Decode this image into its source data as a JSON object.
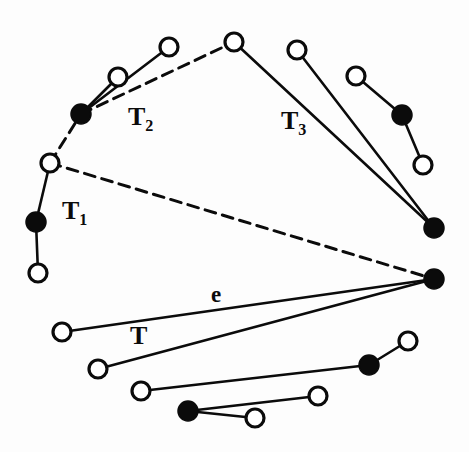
{
  "figure": {
    "background_color": "#fdfdfd",
    "stroke_color": "#0b0b0b",
    "node_fill_open": "#ffffff",
    "node_fill_closed": "#0b0b0b",
    "node_radius": 9,
    "node_stroke_width": 3.2,
    "edge_width_solid": 2.6,
    "edge_width_dashed": 3.0,
    "dash_pattern": "11 7"
  },
  "labels": [
    {
      "id": "label-t1",
      "text": "T",
      "sub": "1",
      "x": 62,
      "y": 198,
      "size": 26
    },
    {
      "id": "label-t2",
      "text": "T",
      "sub": "2",
      "x": 128,
      "y": 104,
      "size": 26
    },
    {
      "id": "label-t3",
      "text": "T",
      "sub": "3",
      "x": 281,
      "y": 108,
      "size": 26
    },
    {
      "id": "label-e",
      "text": "e",
      "sub": "",
      "x": 211,
      "y": 283,
      "size": 23
    },
    {
      "id": "label-t",
      "text": "T",
      "sub": "",
      "x": 130,
      "y": 323,
      "size": 26
    }
  ],
  "nodes": [
    {
      "id": "n-t2-hub",
      "x": 81,
      "y": 114,
      "type": "closed"
    },
    {
      "id": "n-t2-mid",
      "x": 118,
      "y": 77,
      "type": "open"
    },
    {
      "id": "n-t2-far",
      "x": 169,
      "y": 47,
      "type": "open"
    },
    {
      "id": "n-apex",
      "x": 234,
      "y": 42,
      "type": "open"
    },
    {
      "id": "n-top-right",
      "x": 297,
      "y": 50,
      "type": "open"
    },
    {
      "id": "n-right-upper",
      "x": 356,
      "y": 76,
      "type": "open"
    },
    {
      "id": "n-right-mid",
      "x": 402,
      "y": 115,
      "type": "closed"
    },
    {
      "id": "n-right-low",
      "x": 423,
      "y": 165,
      "type": "open"
    },
    {
      "id": "n-right-sink",
      "x": 434,
      "y": 228,
      "type": "closed"
    },
    {
      "id": "n-hub",
      "x": 434,
      "y": 279,
      "type": "closed"
    },
    {
      "id": "n-t1-top",
      "x": 50,
      "y": 163,
      "type": "open"
    },
    {
      "id": "n-t1-mid",
      "x": 36,
      "y": 222,
      "type": "closed"
    },
    {
      "id": "n-t1-bot",
      "x": 38,
      "y": 273,
      "type": "open"
    },
    {
      "id": "n-low-1",
      "x": 62,
      "y": 332,
      "type": "open"
    },
    {
      "id": "n-low-2",
      "x": 98,
      "y": 369,
      "type": "open"
    },
    {
      "id": "n-low-3",
      "x": 141,
      "y": 391,
      "type": "open"
    },
    {
      "id": "n-low-4",
      "x": 188,
      "y": 411,
      "type": "closed"
    },
    {
      "id": "n-low-5",
      "x": 255,
      "y": 418,
      "type": "open"
    },
    {
      "id": "n-low-6",
      "x": 318,
      "y": 396,
      "type": "open"
    },
    {
      "id": "n-low-7",
      "x": 369,
      "y": 365,
      "type": "closed"
    },
    {
      "id": "n-low-8",
      "x": 408,
      "y": 341,
      "type": "open"
    }
  ],
  "edges_solid": [
    {
      "id": "e-t2-hub-mid",
      "from": "n-t2-hub",
      "to": "n-t2-mid"
    },
    {
      "id": "e-t2-hub-far",
      "from": "n-t2-hub",
      "to": "n-t2-far"
    },
    {
      "id": "e-apex-sink",
      "from": "n-apex",
      "to": "n-right-sink"
    },
    {
      "id": "e-topright-sink",
      "from": "n-top-right",
      "to": "n-right-sink"
    },
    {
      "id": "e-rupper-rmid",
      "from": "n-right-upper",
      "to": "n-right-mid"
    },
    {
      "id": "e-rmid-rlow",
      "from": "n-right-mid",
      "to": "n-right-low"
    },
    {
      "id": "e-t1-top-mid",
      "from": "n-t1-top",
      "to": "n-t1-mid"
    },
    {
      "id": "e-t1-mid-bot",
      "from": "n-t1-mid",
      "to": "n-t1-bot"
    },
    {
      "id": "e-low1-hub",
      "from": "n-low-1",
      "to": "n-hub"
    },
    {
      "id": "e-low2-hub",
      "from": "n-low-2",
      "to": "n-hub"
    },
    {
      "id": "e-low3-low7",
      "from": "n-low-3",
      "to": "n-low-7"
    },
    {
      "id": "e-low7-low8",
      "from": "n-low-7",
      "to": "n-low-8"
    },
    {
      "id": "e-low4-low5",
      "from": "n-low-4",
      "to": "n-low-5"
    },
    {
      "id": "e-low4-low6",
      "from": "n-low-4",
      "to": "n-low-6"
    }
  ],
  "edges_dashed": [
    {
      "id": "d-t1top-t2hub",
      "from": "n-t1-top",
      "to": "n-t2-hub"
    },
    {
      "id": "d-t2hub-apex",
      "from": "n-t2-hub",
      "to": "n-apex"
    },
    {
      "id": "d-t1top-hub",
      "from": "n-t1-top",
      "to": "n-hub"
    }
  ]
}
